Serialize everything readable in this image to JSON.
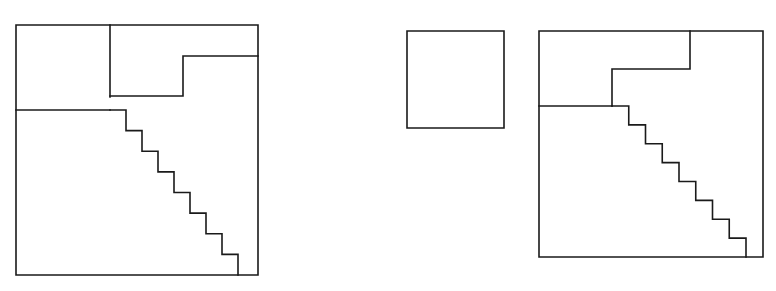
{
  "page": {
    "background_color": "#ffffff",
    "stroke_color": "#1a1a1a",
    "stroke_width": 1.6,
    "width": 776,
    "height": 291
  },
  "chart_data": {
    "type": "diagram",
    "figure_count": 3,
    "figures": [
      {
        "id": "figure-1",
        "name": "divided-square-left",
        "shape": "square",
        "outer": {
          "x": 16,
          "y": 25,
          "width": 242,
          "height": 250
        },
        "pieces": [
          {
            "name": "top-left-square",
            "description": "square sub-region at top left"
          },
          {
            "name": "upper-right-notch",
            "description": "stepped notch piece at top right"
          },
          {
            "name": "staircase-piece",
            "description": "eight-step staircase descending to the right"
          }
        ],
        "internal_segments": [
          {
            "name": "vertical-divider",
            "x1": 110,
            "y1": 25,
            "x2": 110,
            "y2": 97
          },
          {
            "name": "horizontal-divider",
            "x1": 16,
            "y1": 110,
            "x2": 110,
            "y2": 110
          },
          {
            "name": "notch-top",
            "x1": 183,
            "y1": 56,
            "x2": 258,
            "y2": 56
          },
          {
            "name": "notch-vertical",
            "x1": 183,
            "y1": 56,
            "x2": 183,
            "y2": 96
          },
          {
            "name": "notch-bottom",
            "x1": 110,
            "y1": 96,
            "x2": 183,
            "y2": 96
          }
        ],
        "staircase": {
          "steps": 8,
          "start": {
            "x": 110,
            "y": 110
          },
          "end": {
            "x": 238,
            "y": 275
          },
          "step_width": 16,
          "step_height": 20.6
        }
      },
      {
        "id": "figure-2",
        "name": "small-square-middle",
        "shape": "square",
        "outer": {
          "x": 407,
          "y": 31,
          "width": 97,
          "height": 97
        },
        "pieces": [
          {
            "name": "plain-square",
            "description": "undivided small square"
          }
        ],
        "internal_segments": [],
        "staircase": null
      },
      {
        "id": "figure-3",
        "name": "divided-square-right",
        "shape": "square",
        "outer": {
          "x": 539,
          "y": 31,
          "width": 224,
          "height": 226
        },
        "pieces": [
          {
            "name": "upper-notch-piece",
            "description": "stepped notch piece occupying the top band"
          },
          {
            "name": "staircase-piece",
            "description": "eight-step staircase descending to the right"
          }
        ],
        "internal_segments": [
          {
            "name": "notch-vertical-outer",
            "x1": 690,
            "y1": 31,
            "x2": 690,
            "y2": 69
          },
          {
            "name": "notch-top",
            "x1": 612,
            "y1": 69,
            "x2": 690,
            "y2": 69
          },
          {
            "name": "notch-vertical-inner",
            "x1": 612,
            "y1": 69,
            "x2": 612,
            "y2": 106
          },
          {
            "name": "horizontal-divider",
            "x1": 539,
            "y1": 106,
            "x2": 612,
            "y2": 106
          }
        ],
        "staircase": {
          "steps": 8,
          "start": {
            "x": 612,
            "y": 106
          },
          "end": {
            "x": 746,
            "y": 257
          },
          "step_width": 16.75,
          "step_height": 18.9
        }
      }
    ],
    "xlabel": "",
    "ylabel": "",
    "legend": [],
    "grid": false
  }
}
